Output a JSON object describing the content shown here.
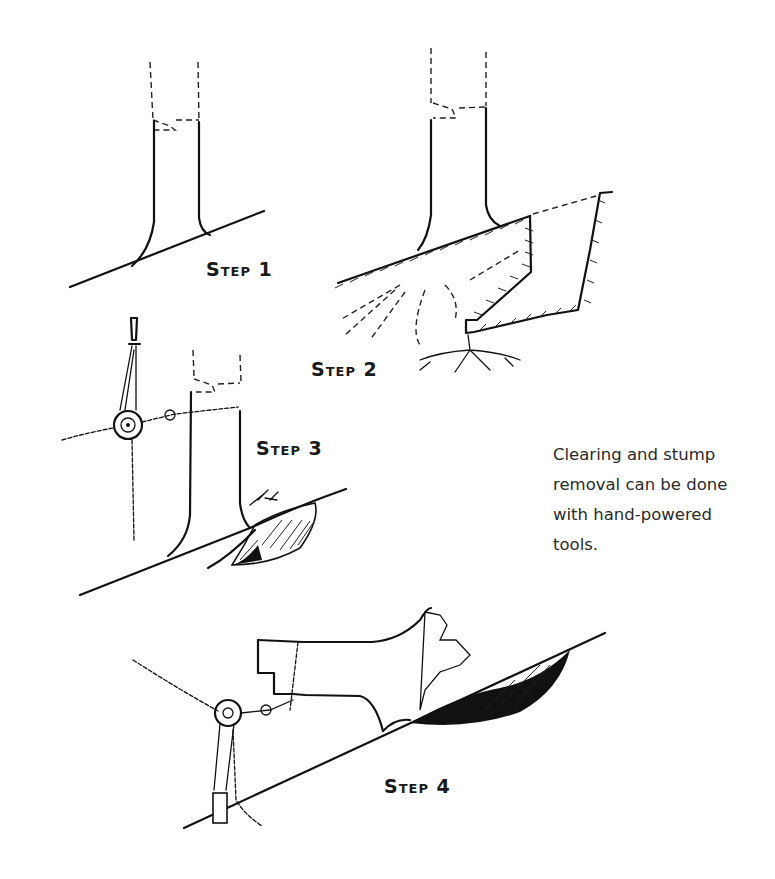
{
  "figure": {
    "steps": [
      {
        "id": 1,
        "label": "Step 1",
        "description": "Tree on slope with planned cut lines"
      },
      {
        "id": 2,
        "label": "Step 2",
        "description": "Digging around stump, exposing roots"
      },
      {
        "id": 3,
        "label": "Step 3",
        "description": "Chain hoist (come-along) attached to trunk"
      },
      {
        "id": 4,
        "label": "Step 4",
        "description": "Stump pulled over with chain hoist, roots torn out"
      }
    ],
    "caption": "Clearing and stump removal can be done with hand-powered tools.",
    "colors": {
      "ink": "#111111",
      "background": "#ffffff",
      "text": "#2a2a2a"
    }
  }
}
